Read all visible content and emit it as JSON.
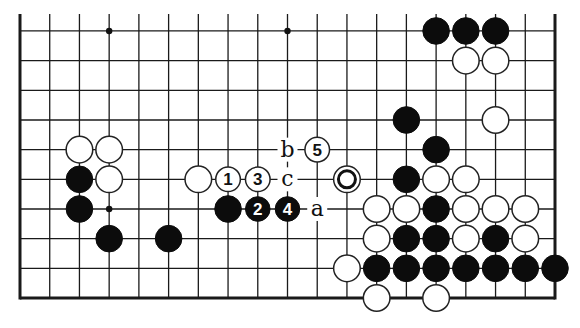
{
  "diagram": {
    "type": "go-board-fragment",
    "board_columns": 19,
    "visible_rows": 10,
    "edges": {
      "left": true,
      "right": true,
      "bottom": true,
      "top": false
    },
    "colors": {
      "line": "#1a1a1a",
      "black": "#0c0c0c",
      "white": "#ffffff",
      "background": "#ffffff"
    },
    "star_points": [
      [
        3,
        10
      ],
      [
        9,
        10
      ],
      [
        3,
        4
      ]
    ],
    "stones": [
      {
        "c": "B",
        "col": 14,
        "row": 10
      },
      {
        "c": "B",
        "col": 15,
        "row": 10
      },
      {
        "c": "B",
        "col": 16,
        "row": 10
      },
      {
        "c": "W",
        "col": 15,
        "row": 9
      },
      {
        "c": "W",
        "col": 16,
        "row": 9
      },
      {
        "c": "B",
        "col": 13,
        "row": 7
      },
      {
        "c": "W",
        "col": 16,
        "row": 7
      },
      {
        "c": "W",
        "col": 2,
        "row": 6
      },
      {
        "c": "W",
        "col": 3,
        "row": 6
      },
      {
        "c": "B",
        "col": 14,
        "row": 6
      },
      {
        "c": "B",
        "col": 2,
        "row": 5
      },
      {
        "c": "W",
        "col": 3,
        "row": 5
      },
      {
        "c": "W",
        "col": 6,
        "row": 5
      },
      {
        "c": "B",
        "col": 13,
        "row": 5
      },
      {
        "c": "W",
        "col": 14,
        "row": 5
      },
      {
        "c": "W",
        "col": 15,
        "row": 5
      },
      {
        "c": "B",
        "col": 2,
        "row": 4
      },
      {
        "c": "B",
        "col": 7,
        "row": 4
      },
      {
        "c": "W",
        "col": 12,
        "row": 4
      },
      {
        "c": "W",
        "col": 13,
        "row": 4
      },
      {
        "c": "B",
        "col": 14,
        "row": 4
      },
      {
        "c": "W",
        "col": 15,
        "row": 4
      },
      {
        "c": "W",
        "col": 16,
        "row": 4
      },
      {
        "c": "W",
        "col": 17,
        "row": 4
      },
      {
        "c": "B",
        "col": 3,
        "row": 3
      },
      {
        "c": "B",
        "col": 5,
        "row": 3
      },
      {
        "c": "W",
        "col": 12,
        "row": 3
      },
      {
        "c": "B",
        "col": 13,
        "row": 3
      },
      {
        "c": "B",
        "col": 14,
        "row": 3
      },
      {
        "c": "W",
        "col": 15,
        "row": 3
      },
      {
        "c": "B",
        "col": 16,
        "row": 3
      },
      {
        "c": "W",
        "col": 17,
        "row": 3
      },
      {
        "c": "W",
        "col": 11,
        "row": 2
      },
      {
        "c": "B",
        "col": 12,
        "row": 2
      },
      {
        "c": "B",
        "col": 13,
        "row": 2
      },
      {
        "c": "B",
        "col": 14,
        "row": 2
      },
      {
        "c": "B",
        "col": 15,
        "row": 2
      },
      {
        "c": "B",
        "col": 16,
        "row": 2
      },
      {
        "c": "B",
        "col": 17,
        "row": 2
      },
      {
        "c": "B",
        "col": 18,
        "row": 2
      },
      {
        "c": "W",
        "col": 12,
        "row": 1
      },
      {
        "c": "W",
        "col": 14,
        "row": 1
      }
    ],
    "marked_stones": [
      {
        "c": "W",
        "col": 11,
        "row": 5,
        "mark": "circle"
      }
    ],
    "numbered_moves": [
      {
        "n": "1",
        "c": "W",
        "col": 7,
        "row": 5
      },
      {
        "n": "2",
        "c": "B",
        "col": 8,
        "row": 4
      },
      {
        "n": "3",
        "c": "W",
        "col": 8,
        "row": 5
      },
      {
        "n": "4",
        "c": "B",
        "col": 9,
        "row": 4
      },
      {
        "n": "5",
        "c": "W",
        "col": 10,
        "row": 6
      }
    ],
    "letter_labels": [
      {
        "text": "a",
        "col": 10,
        "row": 4
      },
      {
        "text": "b",
        "col": 9,
        "row": 6
      },
      {
        "text": "c",
        "col": 9,
        "row": 5
      }
    ]
  }
}
